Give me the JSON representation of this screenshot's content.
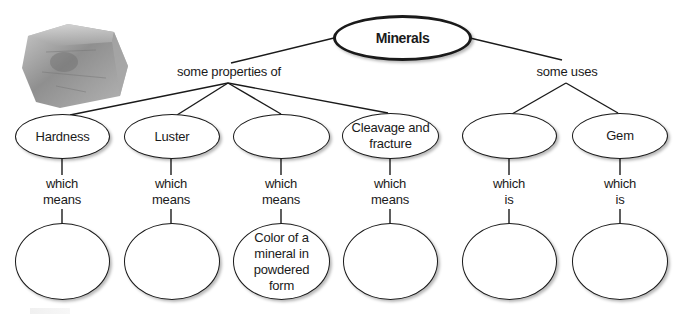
{
  "diagram": {
    "type": "concept-map",
    "root": {
      "label": "Minerals"
    },
    "branches": {
      "left_connector": "some properties of",
      "right_connector": "some uses"
    },
    "properties": [
      {
        "label": "Hardness",
        "linker": [
          "which",
          "means"
        ],
        "definition": ""
      },
      {
        "label": "Luster",
        "linker": [
          "which",
          "means"
        ],
        "definition": ""
      },
      {
        "label": "",
        "linker": [
          "which",
          "means"
        ],
        "definition": "Color of a mineral in powdered form"
      },
      {
        "label": "Cleavage and fracture",
        "linker": [
          "which",
          "means"
        ],
        "definition": ""
      }
    ],
    "uses": [
      {
        "label": "",
        "linker": [
          "which",
          "is"
        ],
        "definition": ""
      },
      {
        "label": "Gem",
        "linker": [
          "which",
          "is"
        ],
        "definition": ""
      }
    ],
    "image": {
      "icon": "mineral-crystal-photo"
    },
    "colors": {
      "stroke": "#1a1a1a",
      "background": "#ffffff",
      "crystal": "#9a9a9a"
    }
  }
}
